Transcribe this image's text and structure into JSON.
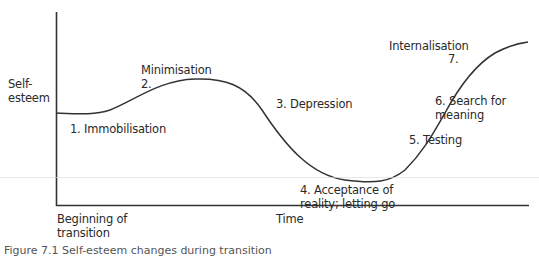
{
  "diagram": {
    "type": "transition-curve",
    "y_axis_label": [
      "Self-",
      "esteem"
    ],
    "x_axis_label": "Time",
    "x_axis_start_label": [
      "Beginning of",
      "transition"
    ],
    "stages": [
      {
        "num": "1.",
        "label": "Immobilisation",
        "text": "1. Immobilisation"
      },
      {
        "num": "2.",
        "label": "Minimisation",
        "text": "Minimisation"
      },
      {
        "num": "3.",
        "label": "Depression",
        "text": "3. Depression"
      },
      {
        "num": "4.",
        "label": "Acceptance of reality; letting go",
        "lines": [
          "4. Acceptance of",
          "reality; letting go"
        ]
      },
      {
        "num": "5.",
        "label": "Testing",
        "text": "5. Testing"
      },
      {
        "num": "6.",
        "label": "Search for meaning",
        "lines": [
          "6. Search for",
          "meaning"
        ]
      },
      {
        "num": "7.",
        "label": "Internalisation",
        "text": "Internalisation"
      }
    ],
    "caption": "Figure 7.1 Self-esteem changes during transition"
  },
  "colors": {
    "line": "#333333",
    "text": "#2a2a2a",
    "background": "#ffffff"
  }
}
